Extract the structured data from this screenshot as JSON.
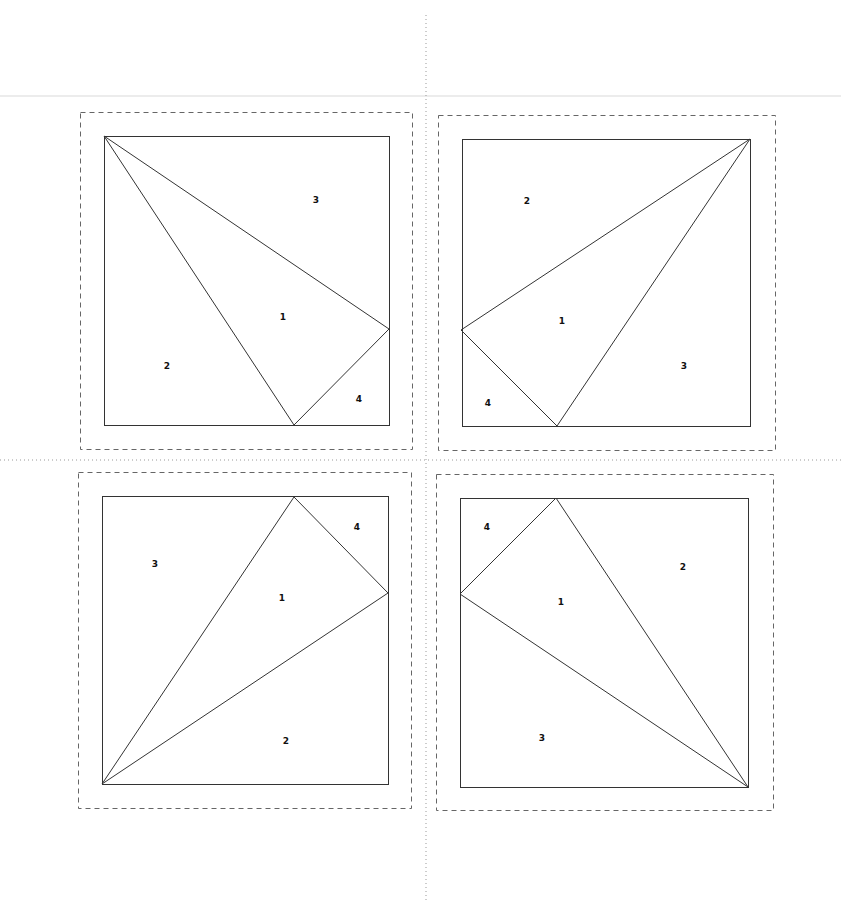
{
  "diagram": {
    "title": "",
    "colors": {
      "line": "#333333",
      "dashed": "#666666",
      "dotted": "#999999",
      "label": "#111111"
    },
    "guides": {
      "vertical_dotted": {
        "x": 426,
        "y1": 15,
        "y2": 903
      },
      "horizontal_dotted": {
        "y": 460,
        "x1": 0,
        "x2": 841
      }
    },
    "blocks": [
      {
        "name": "top-left",
        "dashed": {
          "x": 80,
          "y": 112,
          "w": 332,
          "h": 337
        },
        "square": {
          "x1": 104,
          "y1": 136,
          "x2": 389,
          "y2": 425
        },
        "lines": [
          [
            104,
            136,
            389,
            329
          ],
          [
            104,
            136,
            294,
            425
          ],
          [
            294,
            425,
            389,
            329
          ]
        ],
        "labels": [
          {
            "text": "3",
            "x": 316,
            "y": 203
          },
          {
            "text": "1",
            "x": 283,
            "y": 320
          },
          {
            "text": "2",
            "x": 167,
            "y": 369
          },
          {
            "text": "4",
            "x": 359,
            "y": 402
          }
        ]
      },
      {
        "name": "top-right",
        "dashed": {
          "x": 438,
          "y": 115,
          "w": 337,
          "h": 335
        },
        "square": {
          "x1": 462,
          "y1": 139,
          "x2": 750,
          "y2": 426
        },
        "lines": [
          [
            750,
            139,
            461,
            330
          ],
          [
            750,
            139,
            557,
            426
          ],
          [
            461,
            330,
            557,
            426
          ]
        ],
        "labels": [
          {
            "text": "2",
            "x": 527,
            "y": 204
          },
          {
            "text": "1",
            "x": 562,
            "y": 324
          },
          {
            "text": "3",
            "x": 684,
            "y": 369
          },
          {
            "text": "4",
            "x": 488,
            "y": 406
          }
        ]
      },
      {
        "name": "bottom-left",
        "dashed": {
          "x": 78,
          "y": 472,
          "w": 333,
          "h": 336
        },
        "square": {
          "x1": 102,
          "y1": 496,
          "x2": 388,
          "y2": 784
        },
        "lines": [
          [
            102,
            784,
            294,
            497
          ],
          [
            102,
            784,
            388,
            593
          ],
          [
            294,
            497,
            388,
            593
          ]
        ],
        "labels": [
          {
            "text": "4",
            "x": 357,
            "y": 530
          },
          {
            "text": "3",
            "x": 155,
            "y": 567
          },
          {
            "text": "1",
            "x": 282,
            "y": 601
          },
          {
            "text": "2",
            "x": 286,
            "y": 744
          }
        ]
      },
      {
        "name": "bottom-right",
        "dashed": {
          "x": 436,
          "y": 474,
          "w": 337,
          "h": 336
        },
        "square": {
          "x1": 460,
          "y1": 498,
          "x2": 748,
          "y2": 787
        },
        "lines": [
          [
            748,
            787,
            556,
            498
          ],
          [
            748,
            787,
            460,
            594
          ],
          [
            460,
            594,
            556,
            498
          ]
        ],
        "labels": [
          {
            "text": "4",
            "x": 487,
            "y": 530
          },
          {
            "text": "2",
            "x": 683,
            "y": 570
          },
          {
            "text": "1",
            "x": 561,
            "y": 605
          },
          {
            "text": "3",
            "x": 542,
            "y": 741
          }
        ]
      }
    ]
  }
}
